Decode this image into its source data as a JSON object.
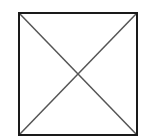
{
  "diagram": {
    "shape": "square-with-diagonals",
    "square": {
      "x": 19,
      "y": 13,
      "width": 118,
      "height": 122,
      "stroke": "#1a1a1a",
      "stroke_width": 2
    },
    "diagonals": [
      {
        "from": [
          19,
          13
        ],
        "to": [
          137,
          135
        ],
        "stroke": "#555555",
        "stroke_width": 1.5
      },
      {
        "from": [
          137,
          13
        ],
        "to": [
          19,
          135
        ],
        "stroke": "#555555",
        "stroke_width": 1.5
      }
    ],
    "background": "#ffffff"
  }
}
